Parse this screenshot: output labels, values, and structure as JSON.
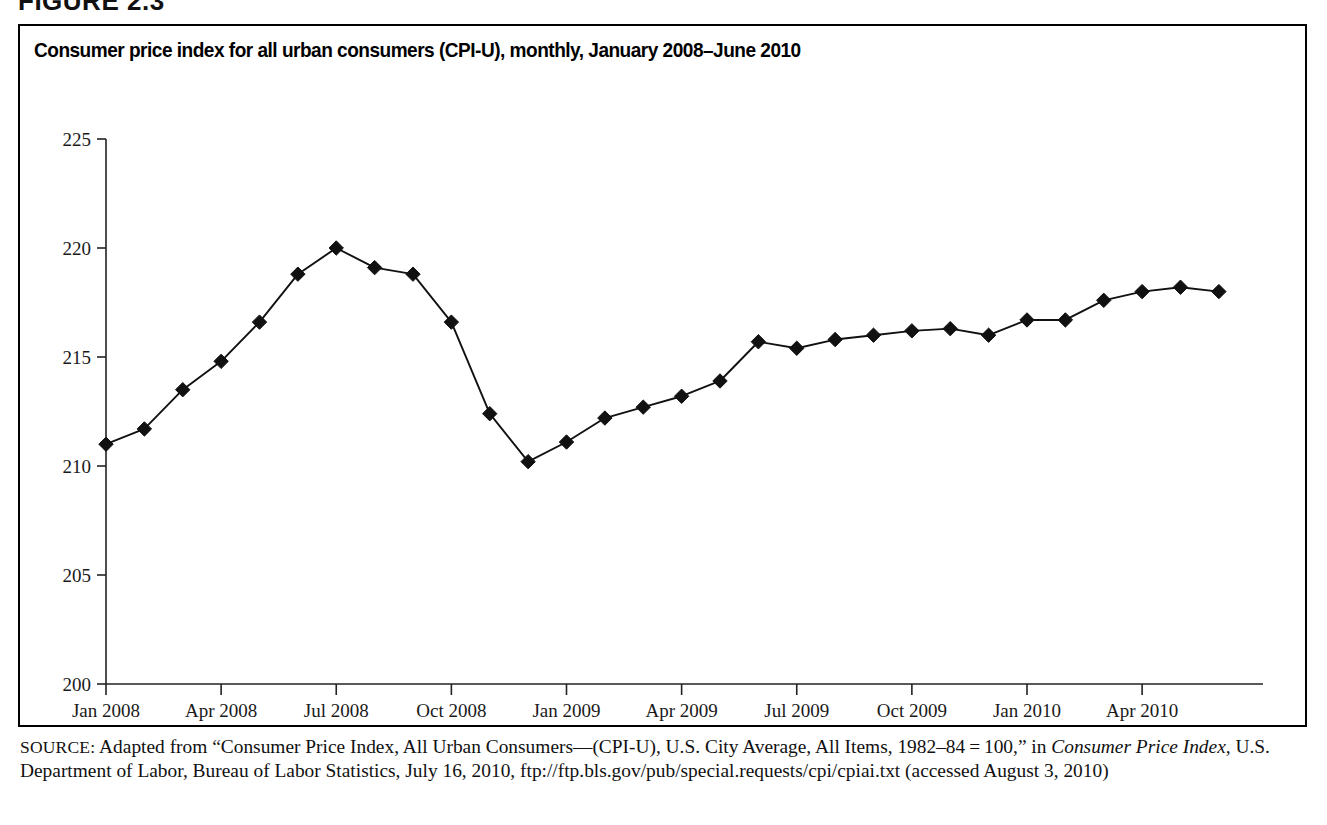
{
  "figure": {
    "label": "FIGURE 2.3"
  },
  "chart_title": "Consumer price index for all urban consumers (CPI-U), monthly, January 2008–June 2010",
  "source": {
    "prefix": "SOURCE:",
    "text_part1": " Adapted from “Consumer Price Index, All Urban Consumers—(CPI-U), U.S. City Average, All Items, 1982–84 = 100,” in ",
    "italic_title": "Consumer Price Index,",
    "text_part2": " U.S. Department of Labor, Bureau of Labor Statistics, July 16, 2010, ftp://ftp.bls.gov/pub/special.requests/cpi/cpiai.txt (accessed August 3, 2010)"
  },
  "chart_data": {
    "type": "line",
    "title": "Consumer price index for all urban consumers (CPI-U), monthly, January 2008–June 2010",
    "xlabel": "",
    "ylabel": "",
    "ylim": [
      200,
      225
    ],
    "yticks": [
      200,
      205,
      210,
      215,
      220,
      225
    ],
    "ytick_labels": [
      "200",
      "205",
      "210",
      "215",
      "220",
      "225"
    ],
    "xtick_labels": [
      "Jan 2008",
      "Apr 2008",
      "Jul 2008",
      "Oct 2008",
      "Jan 2009",
      "Apr 2009",
      "Jul 2009",
      "Oct 2009",
      "Jan 2010",
      "Apr 2010"
    ],
    "xtick_indices": [
      0,
      3,
      6,
      9,
      12,
      15,
      18,
      21,
      24,
      27
    ],
    "grid": false,
    "legend": false,
    "marker": "diamond",
    "series_name": "CPI-U",
    "x": [
      "Jan 2008",
      "Feb 2008",
      "Mar 2008",
      "Apr 2008",
      "May 2008",
      "Jun 2008",
      "Jul 2008",
      "Aug 2008",
      "Sep 2008",
      "Oct 2008",
      "Nov 2008",
      "Dec 2008",
      "Jan 2009",
      "Feb 2009",
      "Mar 2009",
      "Apr 2009",
      "May 2009",
      "Jun 2009",
      "Jul 2009",
      "Aug 2009",
      "Sep 2009",
      "Oct 2009",
      "Nov 2009",
      "Dec 2009",
      "Jan 2010",
      "Feb 2010",
      "Mar 2010",
      "Apr 2010",
      "May 2010",
      "Jun 2010"
    ],
    "values": [
      211.0,
      211.7,
      213.5,
      214.8,
      216.6,
      218.8,
      220.0,
      219.1,
      218.8,
      216.6,
      212.4,
      210.2,
      211.1,
      212.2,
      212.7,
      213.2,
      213.9,
      215.7,
      215.4,
      215.8,
      216.0,
      216.2,
      216.3,
      216.0,
      216.7,
      216.7,
      217.6,
      218.0,
      218.2,
      218.0
    ]
  }
}
